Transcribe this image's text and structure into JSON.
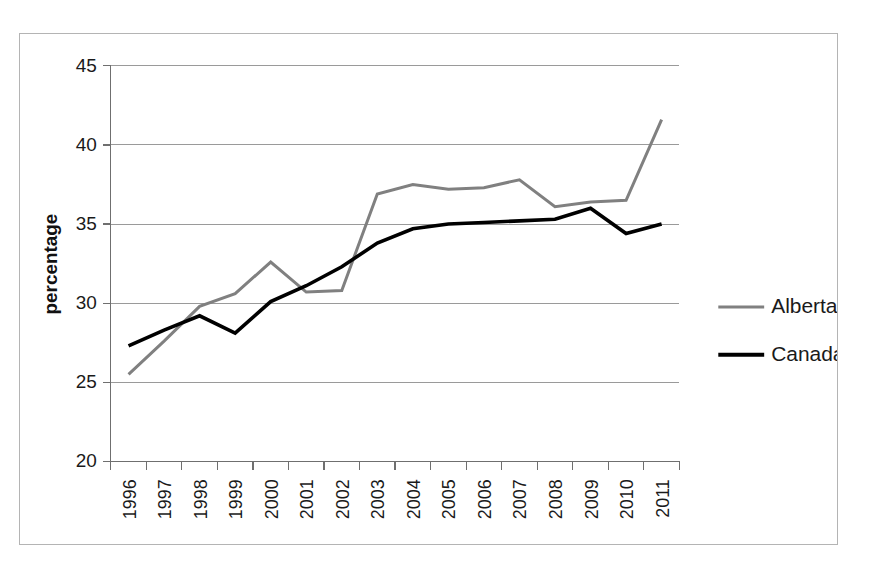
{
  "chart_data": {
    "type": "line",
    "title": "",
    "xlabel": "",
    "ylabel": "percentage",
    "ylim": [
      20,
      45
    ],
    "yticks": [
      20,
      25,
      30,
      35,
      40,
      45
    ],
    "ytick_labels": [
      "20",
      "25",
      "30",
      "35",
      "40",
      "45"
    ],
    "grid": true,
    "grid_axis": "y",
    "legend_position": "right",
    "categories": [
      "1996",
      "1997",
      "1998",
      "1999",
      "2000",
      "2001",
      "2002",
      "2003",
      "2004",
      "2005",
      "2006",
      "2007",
      "2008",
      "2009",
      "2010",
      "2011"
    ],
    "x": [
      1996,
      1997,
      1998,
      1999,
      2000,
      2001,
      2002,
      2003,
      2004,
      2005,
      2006,
      2007,
      2008,
      2009,
      2010,
      2011
    ],
    "series": [
      {
        "name": "Alberta",
        "color": "#808080",
        "line_width": 3,
        "values": [
          25.5,
          27.6,
          29.8,
          30.6,
          32.6,
          30.7,
          30.8,
          36.9,
          37.5,
          37.2,
          37.3,
          37.8,
          36.1,
          36.4,
          36.5,
          41.6
        ]
      },
      {
        "name": "Canada",
        "color": "#000000",
        "line_width": 3.6,
        "values": [
          27.3,
          28.3,
          29.2,
          28.1,
          30.1,
          31.1,
          32.3,
          33.8,
          34.7,
          35.0,
          35.1,
          35.2,
          35.3,
          36.0,
          34.4,
          35.0
        ]
      }
    ]
  },
  "legend": {
    "items": [
      {
        "label": "Alberta",
        "color": "#808080"
      },
      {
        "label": "Canada",
        "color": "#000000"
      }
    ]
  },
  "axes": {
    "y_title": "percentage"
  }
}
